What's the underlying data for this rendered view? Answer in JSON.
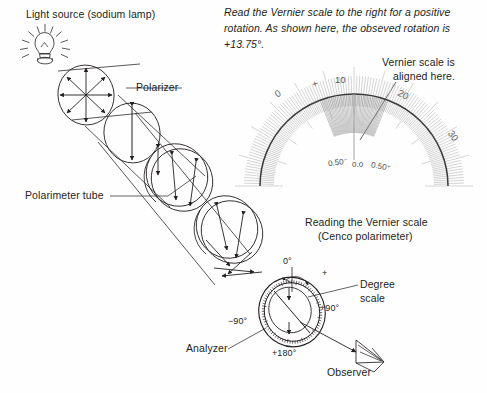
{
  "figure": {
    "title_note": "Polarimeter optical train and Vernier scale reading",
    "background_color": "#fefefe",
    "ink_color": "#231f20",
    "scale_tick_color": "#9a9a9a"
  },
  "labels": {
    "light_source": "Light source (sodium lamp)",
    "polarizer": "Polarizer",
    "polarimeter_tube": "Polarimeter tube",
    "analyzer": "Analyzer",
    "observer": "Observer",
    "degree_scale_line1": "Degree",
    "degree_scale_line2": "scale",
    "vernier_aligned_line1": "Vernier scale is",
    "vernier_aligned_line2": "aligned here.",
    "reading_caption_line1": "Reading the Vernier scale",
    "reading_caption_line2": "(Cenco polarimeter)"
  },
  "instruction": {
    "line1": "Read the Vernier scale to the right for a positive",
    "line2": "rotation. As shown here, the obseved rotation is",
    "line3": "+13.75°."
  },
  "observed_rotation": "+13.75°",
  "vernier_scale": {
    "main_labels": [
      "0",
      "+",
      "10",
      "20",
      "30"
    ],
    "fine_labels": [
      "0.50⁻",
      "0.0",
      "0.50⁺"
    ],
    "aligned_value": "13.75"
  },
  "degree_dial": {
    "zero_mark": "0°",
    "plus_mark": "+",
    "minus_mark": "−",
    "marks": [
      "0°",
      "+90°",
      "+180°",
      "−90°"
    ]
  },
  "chart_data": {
    "type": "diagram",
    "title": "Reading the Vernier scale (Cenco polarimeter)",
    "components": [
      {
        "name": "light-source",
        "label": "Light source (sodium lamp)"
      },
      {
        "name": "polarizer",
        "label": "Polarizer"
      },
      {
        "name": "polarimeter-tube",
        "label": "Polarimeter tube"
      },
      {
        "name": "analyzer",
        "label": "Analyzer"
      },
      {
        "name": "observer",
        "label": "Observer"
      }
    ],
    "readings": {
      "observed_rotation_degrees": 13.75
    }
  }
}
